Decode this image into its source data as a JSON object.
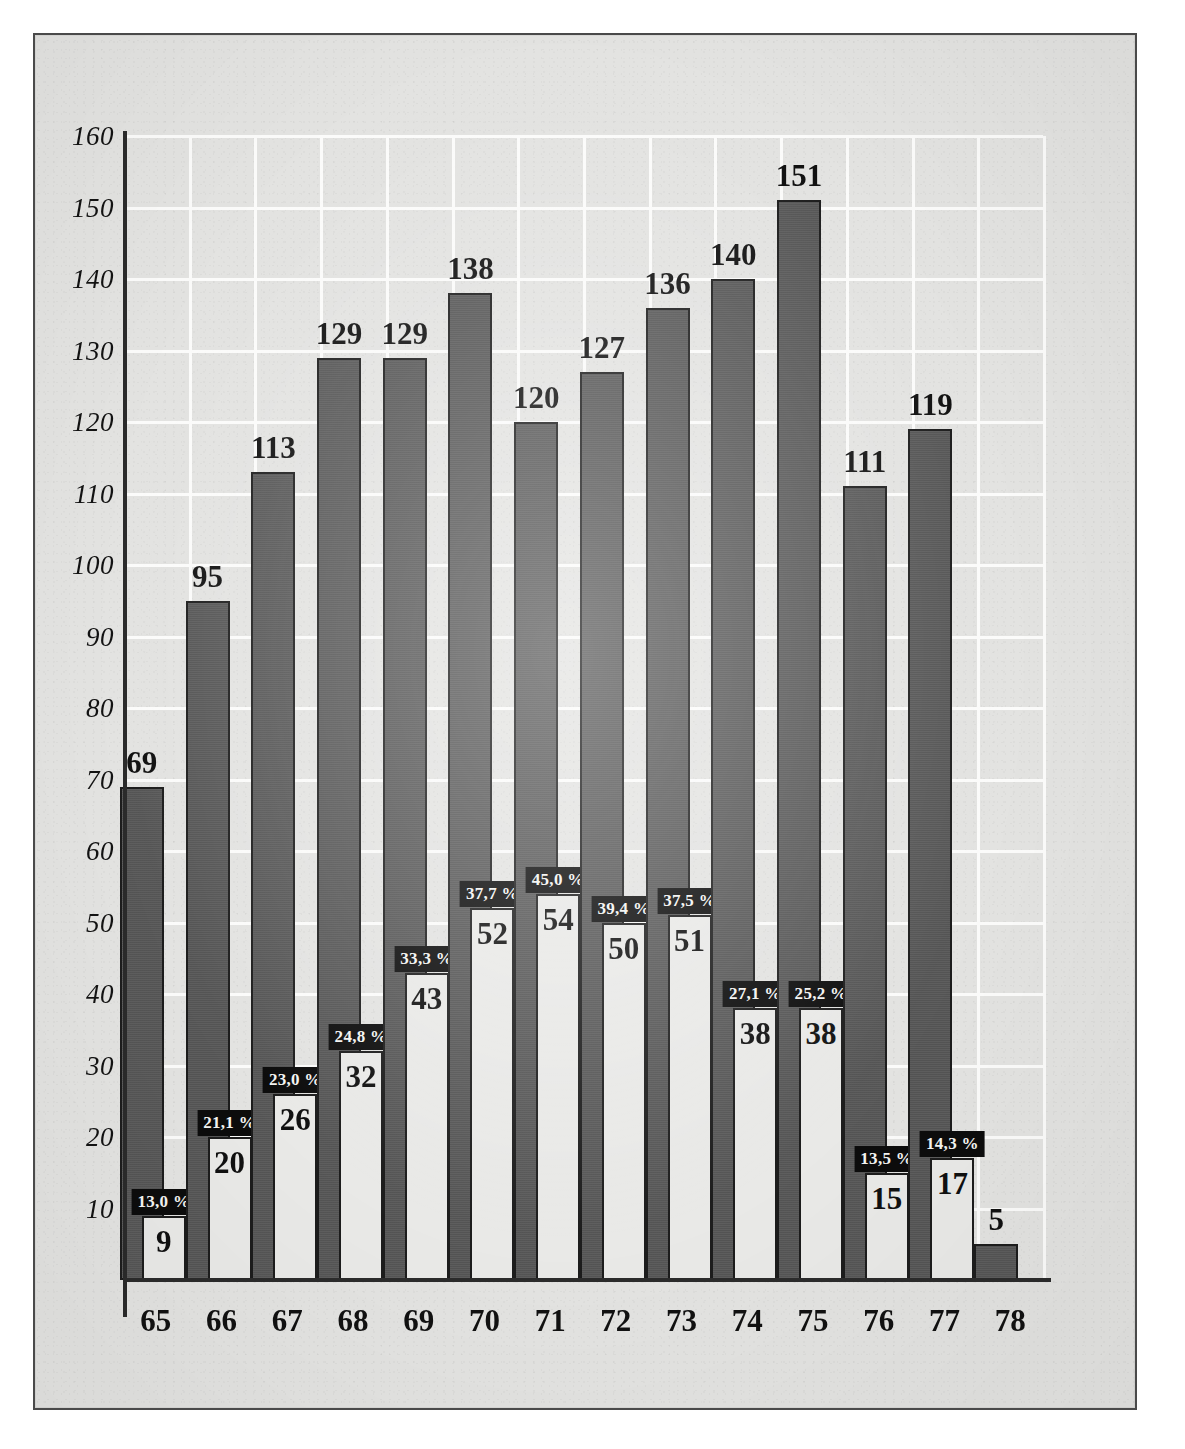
{
  "chart_data": {
    "type": "bar",
    "title": "",
    "subtitle": "",
    "xlabel": "",
    "ylabel": "",
    "categories": [
      "65",
      "66",
      "67",
      "68",
      "69",
      "70",
      "71",
      "72",
      "73",
      "74",
      "75",
      "76",
      "77",
      "78"
    ],
    "ylim": [
      0,
      160
    ],
    "yticks": [
      10,
      20,
      30,
      40,
      50,
      60,
      70,
      80,
      90,
      100,
      110,
      120,
      130,
      140,
      150,
      160
    ],
    "ytick_labels": [
      "10",
      "20",
      "30",
      "40",
      "50",
      "60",
      "70",
      "80",
      "90",
      "100",
      "110",
      "120",
      "130",
      "140",
      "150",
      "160"
    ],
    "grid": true,
    "legend": "none",
    "series": [
      {
        "name": "total",
        "style": "dark-bar",
        "values": [
          69,
          95,
          113,
          129,
          129,
          138,
          120,
          127,
          136,
          140,
          151,
          111,
          119,
          5
        ],
        "labels": [
          "69",
          "95",
          "113",
          "129",
          "129",
          "138",
          "120",
          "127",
          "136",
          "140",
          "151",
          "111",
          "119",
          "5"
        ]
      },
      {
        "name": "subset",
        "style": "light-bar",
        "values": [
          9,
          20,
          26,
          32,
          43,
          52,
          54,
          50,
          51,
          38,
          38,
          15,
          17,
          null
        ],
        "labels": [
          "9",
          "20",
          "26",
          "32",
          "43",
          "52",
          "54",
          "50",
          "51",
          "38",
          "38",
          "15",
          "17",
          ""
        ],
        "percent_labels": [
          "13,0 %",
          "21,1 %",
          "23,0 %",
          "24,8 %",
          "33,3 %",
          "37,7 %",
          "45,0 %",
          "39,4 %",
          "37,5 %",
          "27,1 %",
          "25,2 %",
          "13,5 %",
          "14,3 %",
          ""
        ]
      }
    ]
  },
  "colors": {
    "paper": "#e3e3e1",
    "frame": "#4a4a4a",
    "dark_bar": "#575757",
    "light_bar": "#e9e9e7",
    "bar_outline": "#1d1d1d",
    "gridline": "#fbfbfa",
    "axis": "#2b2b2b",
    "badge_bg": "#0d0d0d",
    "badge_text": "#f4f4f2",
    "text": "#121212"
  }
}
